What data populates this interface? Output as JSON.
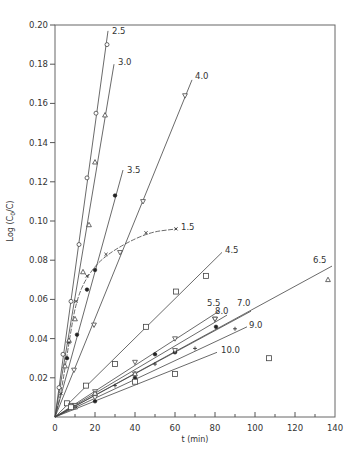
{
  "chart_data": {
    "type": "line",
    "title": "",
    "xlabel": "t (min)",
    "ylabel": "Log (C0/C)",
    "xlim": [
      0,
      140
    ],
    "ylim": [
      0,
      0.2
    ],
    "xticks": [
      0,
      20,
      40,
      60,
      80,
      100,
      120,
      140
    ],
    "xtick_labels": [
      "0",
      "20",
      "40",
      "60",
      "80",
      "100",
      "120",
      "140"
    ],
    "yticks": [
      0.02,
      0.04,
      0.06,
      0.08,
      0.1,
      0.12,
      0.14,
      0.16,
      0.18,
      0.2
    ],
    "ytick_labels": [
      "0.02",
      "0.04",
      "0.06",
      "0.08",
      "0.10",
      "0.12",
      "0.14",
      "0.16",
      "0.18",
      "0.20"
    ],
    "grid": false,
    "legend": "inline labels at line ends",
    "series": [
      {
        "name": "2.5",
        "marker": "circle",
        "line_end": [
          26.5,
          0.197
        ],
        "points": [
          [
            2,
            0.015
          ],
          [
            4,
            0.032
          ],
          [
            8,
            0.059
          ],
          [
            12,
            0.088
          ],
          [
            16,
            0.122
          ],
          [
            20.5,
            0.155
          ],
          [
            26,
            0.19
          ]
        ]
      },
      {
        "name": "3.0",
        "marker": "triangle-up",
        "line_end": [
          29.5,
          0.18
        ],
        "points": [
          [
            5,
            0.026
          ],
          [
            7,
            0.039
          ],
          [
            10,
            0.05
          ],
          [
            14,
            0.074
          ],
          [
            17,
            0.098
          ],
          [
            20,
            0.13
          ],
          [
            25,
            0.154
          ]
        ]
      },
      {
        "name": "3.5",
        "marker": "filled-circle",
        "line_end": [
          34,
          0.126
        ],
        "points": [
          [
            6,
            0.03
          ],
          [
            11,
            0.042
          ],
          [
            16,
            0.065
          ],
          [
            20,
            0.075
          ],
          [
            30,
            0.113
          ]
        ]
      },
      {
        "name": "4.0",
        "marker": "triangle-down",
        "line_end": [
          68.5,
          0.172
        ],
        "points": [
          [
            9.5,
            0.024
          ],
          [
            19.5,
            0.047
          ],
          [
            32.5,
            0.084
          ],
          [
            44,
            0.11
          ],
          [
            65,
            0.164
          ]
        ]
      },
      {
        "name": "1.5",
        "marker": "x",
        "curve": true,
        "line_end": [
          61,
          0.096
        ],
        "points": [
          [
            3,
            0.012
          ],
          [
            7,
            0.038
          ],
          [
            10.5,
            0.059
          ],
          [
            16,
            0.072
          ],
          [
            25.5,
            0.083
          ],
          [
            45.5,
            0.094
          ],
          [
            60.5,
            0.096
          ]
        ]
      },
      {
        "name": "4.5",
        "marker": "square",
        "line_end": [
          83.5,
          0.084
        ],
        "points": [
          [
            6,
            0.007
          ],
          [
            15.5,
            0.016
          ],
          [
            30,
            0.027
          ],
          [
            45.5,
            0.046
          ],
          [
            60.5,
            0.064
          ],
          [
            75.5,
            0.072
          ]
        ]
      },
      {
        "name": "5.5",
        "marker": "triangle-down",
        "line_end": [
          82,
          0.054
        ],
        "points": [
          [
            8,
            0.006
          ],
          [
            20,
            0.013
          ],
          [
            40,
            0.028
          ],
          [
            60,
            0.04
          ],
          [
            80,
            0.05
          ]
        ]
      },
      {
        "name": "8.0",
        "marker": "filled-circle",
        "line_end": [
          86,
          0.052
        ],
        "points": [
          [
            20,
            0.008
          ],
          [
            40,
            0.02
          ],
          [
            50,
            0.032
          ],
          [
            60,
            0.033
          ],
          [
            80.5,
            0.046
          ]
        ]
      },
      {
        "name": "7.0",
        "marker": "triangle-down",
        "line_end": [
          98,
          0.054
        ],
        "points": [
          [
            10,
            0.006
          ],
          [
            20,
            0.01
          ],
          [
            40,
            0.022
          ],
          [
            60,
            0.034
          ],
          [
            80,
            0.05
          ]
        ]
      },
      {
        "name": "6.5",
        "marker": "triangle-up",
        "line_end": [
          138.5,
          0.077
        ],
        "points": [
          [
            10,
            0.005
          ],
          [
            20,
            0.012
          ],
          [
            40,
            0.022
          ],
          [
            136.5,
            0.07
          ]
        ]
      },
      {
        "name": "9.0",
        "marker": "plus",
        "line_end": [
          96,
          0.046
        ],
        "points": [
          [
            10,
            0.005
          ],
          [
            30,
            0.016
          ],
          [
            50,
            0.027
          ],
          [
            70,
            0.035
          ],
          [
            90,
            0.045
          ]
        ]
      },
      {
        "name": "10.0",
        "marker": "square",
        "line_end": [
          81,
          0.033
        ],
        "points": [
          [
            8,
            0.005
          ],
          [
            40,
            0.018
          ],
          [
            60,
            0.022
          ],
          [
            107,
            0.03
          ]
        ]
      }
    ],
    "label_positions": {
      "2.5": [
        27.5,
        0.197
      ],
      "3.0": [
        30.5,
        0.181
      ],
      "3.5": [
        35,
        0.126
      ],
      "4.0": [
        69,
        0.174
      ],
      "1.5": [
        62,
        0.097
      ],
      "4.5": [
        84,
        0.085
      ],
      "5.5": [
        75,
        0.058
      ],
      "8.0": [
        79,
        0.054
      ],
      "7.0": [
        90,
        0.058
      ],
      "6.5": [
        128,
        0.08
      ],
      "9.0": [
        96,
        0.047
      ],
      "10.0": [
        82,
        0.034
      ]
    }
  }
}
